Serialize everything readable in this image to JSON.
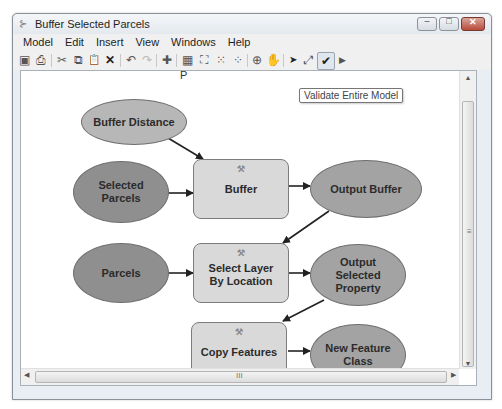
{
  "window": {
    "title": "Buffer Selected Parcels",
    "app_icon": "model-builder-icon",
    "controls": {
      "minimize": "–",
      "maximize": "□",
      "close": "✕"
    }
  },
  "menubar": {
    "items": [
      {
        "label": "Model"
      },
      {
        "label": "Edit"
      },
      {
        "label": "Insert"
      },
      {
        "label": "View"
      },
      {
        "label": "Windows"
      },
      {
        "label": "Help"
      }
    ]
  },
  "toolbar": {
    "buttons": [
      {
        "name": "save",
        "glyph": "▣"
      },
      {
        "name": "print",
        "glyph": "⎙"
      },
      {
        "name": "cut",
        "glyph": "✂"
      },
      {
        "name": "copy",
        "glyph": "⧉"
      },
      {
        "name": "paste",
        "glyph": "📋"
      },
      {
        "name": "delete",
        "glyph": "✕"
      },
      {
        "name": "undo",
        "glyph": "↶"
      },
      {
        "name": "redo",
        "glyph": "↷"
      },
      {
        "name": "add-data",
        "glyph": "✚"
      },
      {
        "name": "auto-layout",
        "glyph": "▦"
      },
      {
        "name": "full-extent",
        "glyph": "⛶"
      },
      {
        "name": "fixed-zoom-in",
        "glyph": "⁙"
      },
      {
        "name": "fixed-zoom-out",
        "glyph": "⁘"
      },
      {
        "name": "zoom-in",
        "glyph": "⊕"
      },
      {
        "name": "pan",
        "glyph": "✋"
      },
      {
        "name": "select",
        "glyph": "➤"
      },
      {
        "name": "connect",
        "glyph": "⤢"
      },
      {
        "name": "validate",
        "glyph": "✔"
      },
      {
        "name": "run",
        "glyph": "▶"
      }
    ],
    "tooltip": "Validate Entire Model"
  },
  "canvas": {
    "marker": "P",
    "nodes": [
      {
        "id": "buffer-distance",
        "label": "Buffer Distance",
        "type": "variable"
      },
      {
        "id": "selected-parcels",
        "label": "Selected Parcels",
        "type": "input"
      },
      {
        "id": "buffer",
        "label": "Buffer",
        "type": "tool"
      },
      {
        "id": "output-buffer",
        "label": "Output Buffer",
        "type": "output"
      },
      {
        "id": "parcels",
        "label": "Parcels",
        "type": "input"
      },
      {
        "id": "select-layer-by-location",
        "label": "Select Layer By Location",
        "type": "tool"
      },
      {
        "id": "output-selected-property",
        "label": "Output Selected Property",
        "type": "output"
      },
      {
        "id": "copy-features",
        "label": "Copy Features",
        "type": "tool"
      },
      {
        "id": "new-feature-class",
        "label": "New Feature Class",
        "type": "output"
      }
    ],
    "colors": {
      "variable": "#b7b7b7",
      "input": "#8f8f8f",
      "output": "#a3a3a3",
      "tool": "#d9d9d9"
    }
  },
  "scrollbars": {
    "h_grip": "III",
    "v_grip": "≡"
  }
}
